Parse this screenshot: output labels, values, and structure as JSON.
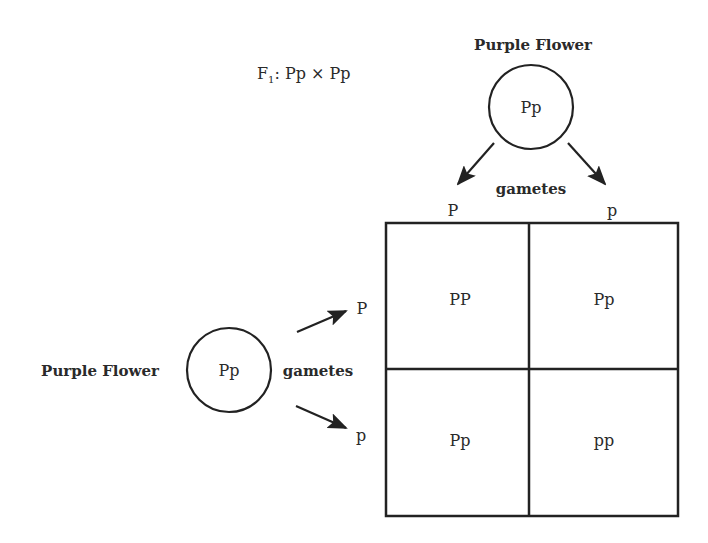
{
  "cross_label": {
    "prefix": "F",
    "subscript": "1",
    "text": ": Pp × Pp"
  },
  "top_parent": {
    "label": "Purple Flower",
    "genotype": "Pp",
    "gametes_label": "gametes",
    "gametes": [
      "P",
      "p"
    ]
  },
  "left_parent": {
    "label": "Purple Flower",
    "genotype": "Pp",
    "gametes_label": "gametes",
    "gametes": [
      "P",
      "p"
    ]
  },
  "punnett_square": {
    "rows": [
      [
        "PP",
        "Pp"
      ],
      [
        "Pp",
        "pp"
      ]
    ]
  },
  "colors": {
    "line": "#222222",
    "text": "#2a2a2a",
    "background": "#ffffff"
  }
}
